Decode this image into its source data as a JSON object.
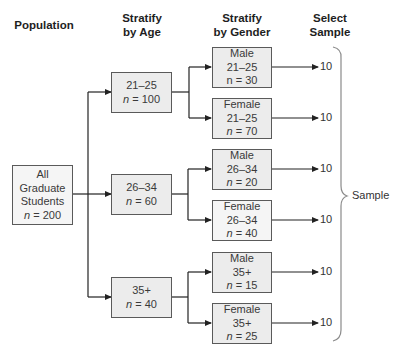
{
  "top_fragment": "",
  "headers": {
    "population": "Population",
    "age_line1": "Stratify",
    "age_line2": "by Age",
    "gender_line1": "Stratify",
    "gender_line2": "by Gender",
    "select_line1": "Select",
    "select_line2": "Sample"
  },
  "population": {
    "line1": "All",
    "line2": "Graduate",
    "line3": "Students",
    "n_var": "n",
    "n_rest": " = 200"
  },
  "age_groups": [
    {
      "range": "21–25",
      "n_var": "n",
      "n_rest": " = 100"
    },
    {
      "range": "26–34",
      "n_var": "n",
      "n_rest": " = 60"
    },
    {
      "range": "35+",
      "n_var": "n",
      "n_rest": " = 40"
    }
  ],
  "gender_groups": [
    {
      "gender": "Male",
      "range": "21–25",
      "n_var": "n",
      "n_rest": " = 30",
      "sample": "10"
    },
    {
      "gender": "Female",
      "range": "21–25",
      "n_var": "n",
      "n_rest": " = 70",
      "sample": "10"
    },
    {
      "gender": "Male",
      "range": "26–34",
      "n_var": "n",
      "n_rest": " = 20",
      "sample": "10"
    },
    {
      "gender": "Female",
      "range": "26–34",
      "n_var": "n",
      "n_rest": " = 40",
      "sample": "10"
    },
    {
      "gender": "Male",
      "range": "35+",
      "n_var": "n",
      "n_rest": " = 15",
      "sample": "10"
    },
    {
      "gender": "Female",
      "range": "35+",
      "n_var": "n",
      "n_rest": " = 25",
      "sample": "10"
    }
  ],
  "brace_label": "Sample",
  "colors": {
    "line": "#222222",
    "box_border": "#5a5a5a",
    "box_shade": "#ececec",
    "box_light": "#f5f5f5",
    "brace": "#8a8a8a"
  }
}
